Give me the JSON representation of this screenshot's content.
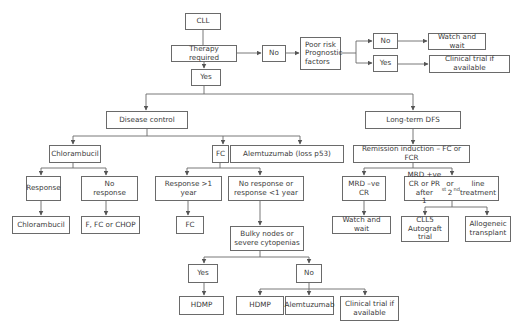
{
  "diagram": {
    "type": "flowchart",
    "colors": {
      "stroke": "#6a6a6a",
      "text": "#3a3a3a",
      "background": "#ffffff"
    },
    "nodes": [
      {
        "id": "cll",
        "label": "CLL",
        "x": 185,
        "y": 13,
        "w": 36,
        "h": 17
      },
      {
        "id": "therapy_required",
        "label": "Therapy required",
        "x": 171,
        "y": 45,
        "w": 66,
        "h": 17
      },
      {
        "id": "no_top",
        "label": "No",
        "x": 262,
        "y": 45,
        "w": 24,
        "h": 17
      },
      {
        "id": "poor_risk",
        "label": "Poor risk\nPrognostic\nfactors",
        "x": 300,
        "y": 37,
        "w": 41,
        "h": 33,
        "align": "left"
      },
      {
        "id": "no_right",
        "label": "No",
        "x": 373,
        "y": 33,
        "w": 25,
        "h": 16
      },
      {
        "id": "yes_right",
        "label": "Yes",
        "x": 373,
        "y": 55,
        "w": 25,
        "h": 17
      },
      {
        "id": "watch_wait_top",
        "label": "Watch and wait",
        "x": 428,
        "y": 33,
        "w": 58,
        "h": 17
      },
      {
        "id": "clinical_trial_top",
        "label": "Clinical trial if available",
        "x": 429,
        "y": 55,
        "w": 81,
        "h": 18
      },
      {
        "id": "yes_mid",
        "label": "Yes",
        "x": 191,
        "y": 69,
        "w": 30,
        "h": 17
      },
      {
        "id": "disease_control",
        "label": "Disease control",
        "x": 106,
        "y": 111,
        "w": 82,
        "h": 18
      },
      {
        "id": "long_term_dfs",
        "label": "Long-term DFS",
        "x": 365,
        "y": 111,
        "w": 96,
        "h": 18
      },
      {
        "id": "chlorambucil_1",
        "label": "Chlorambucil",
        "x": 49,
        "y": 145,
        "w": 52,
        "h": 18
      },
      {
        "id": "fc_1",
        "label": "FC",
        "x": 212,
        "y": 145,
        "w": 17,
        "h": 18
      },
      {
        "id": "alemtuzumab_p53",
        "label": "Alemtuzumab (loss p53)",
        "x": 230,
        "y": 145,
        "w": 114,
        "h": 18
      },
      {
        "id": "remission_induction",
        "label": "Remission induction – FC or FCR",
        "x": 353,
        "y": 145,
        "w": 117,
        "h": 18
      },
      {
        "id": "response",
        "label": "Response",
        "x": 26,
        "y": 176,
        "w": 35,
        "h": 25
      },
      {
        "id": "no_response",
        "label": "No\nresponse",
        "x": 81,
        "y": 176,
        "w": 57,
        "h": 25
      },
      {
        "id": "response_gt1",
        "label": "Response >1\nyear",
        "x": 155,
        "y": 176,
        "w": 67,
        "h": 25
      },
      {
        "id": "no_response_lt1",
        "label": "No response or\nresponse <1 year",
        "x": 228,
        "y": 176,
        "w": 76,
        "h": 25
      },
      {
        "id": "mrd_neg_cr",
        "label": "MRD –ve\nCR",
        "x": 342,
        "y": 176,
        "w": 44,
        "h": 25
      },
      {
        "id": "mrd_pos",
        "label": "MRD +ve CR or PR after\n1st or 2nd line treatment",
        "x": 404,
        "y": 176,
        "w": 95,
        "h": 25
      },
      {
        "id": "chlorambucil_2",
        "label": "Chlorambucil",
        "x": 12,
        "y": 216,
        "w": 58,
        "h": 18
      },
      {
        "id": "f_fc_chop",
        "label": "F, FC or CHOP",
        "x": 81,
        "y": 216,
        "w": 59,
        "h": 18
      },
      {
        "id": "fc_2",
        "label": "FC",
        "x": 176,
        "y": 216,
        "w": 28,
        "h": 18
      },
      {
        "id": "bulky_nodes",
        "label": "Bulky nodes or\nsevere cytopenias",
        "x": 230,
        "y": 226,
        "w": 74,
        "h": 25
      },
      {
        "id": "watch_wait_bottom",
        "label": "Watch and wait",
        "x": 332,
        "y": 216,
        "w": 59,
        "h": 18
      },
      {
        "id": "cll5_autograft",
        "label": "CLL5\nAutograft trial",
        "x": 401,
        "y": 216,
        "w": 48,
        "h": 26
      },
      {
        "id": "allogeneic",
        "label": "Allogeneic\ntransplant",
        "x": 465,
        "y": 216,
        "w": 46,
        "h": 26
      },
      {
        "id": "yes_bottom",
        "label": "Yes",
        "x": 188,
        "y": 264,
        "w": 30,
        "h": 19
      },
      {
        "id": "no_bottom",
        "label": "No",
        "x": 296,
        "y": 264,
        "w": 26,
        "h": 19
      },
      {
        "id": "hdmp_1",
        "label": "HDMP",
        "x": 179,
        "y": 296,
        "w": 45,
        "h": 19
      },
      {
        "id": "hdmp_2",
        "label": "HDMP",
        "x": 236,
        "y": 296,
        "w": 48,
        "h": 19
      },
      {
        "id": "alemtuzumab",
        "label": "Alemtuzumab",
        "x": 285,
        "y": 296,
        "w": 49,
        "h": 19
      },
      {
        "id": "clinical_trial_bottom",
        "label": "Clinical trial if\navailable",
        "x": 340,
        "y": 296,
        "w": 59,
        "h": 25
      }
    ],
    "edges": [
      {
        "from": "cll",
        "to": "therapy_required",
        "arrow": false
      },
      {
        "from": "therapy_required",
        "to": "no_top",
        "arrow": true
      },
      {
        "from": "no_top",
        "to": "poor_risk",
        "arrow": true
      },
      {
        "from": "poor_risk",
        "to": "no_right",
        "arrow": true
      },
      {
        "from": "poor_risk",
        "to": "yes_right",
        "arrow": true
      },
      {
        "from": "no_right",
        "to": "watch_wait_top",
        "arrow": true
      },
      {
        "from": "yes_right",
        "to": "clinical_trial_top",
        "arrow": true
      },
      {
        "from": "therapy_required",
        "to": "yes_mid",
        "arrow": true
      },
      {
        "from": "yes_mid",
        "to": "disease_control",
        "arrow": true
      },
      {
        "from": "yes_mid",
        "to": "long_term_dfs",
        "arrow": true
      },
      {
        "from": "disease_control",
        "to": "chlorambucil_1",
        "arrow": true
      },
      {
        "from": "disease_control",
        "to": "fc_1",
        "arrow": true
      },
      {
        "from": "disease_control",
        "to": "alemtuzumab_p53",
        "arrow": true
      },
      {
        "from": "long_term_dfs",
        "to": "remission_induction",
        "arrow": true
      },
      {
        "from": "chlorambucil_1",
        "to": "response",
        "arrow": true
      },
      {
        "from": "chlorambucil_1",
        "to": "no_response",
        "arrow": true
      },
      {
        "from": "response",
        "to": "chlorambucil_2",
        "arrow": true
      },
      {
        "from": "no_response",
        "to": "f_fc_chop",
        "arrow": true
      },
      {
        "from": "fc_1",
        "to": "response_gt1",
        "arrow": true
      },
      {
        "from": "fc_1",
        "to": "no_response_lt1",
        "arrow": true
      },
      {
        "from": "response_gt1",
        "to": "fc_2",
        "arrow": true
      },
      {
        "from": "no_response_lt1",
        "to": "bulky_nodes",
        "arrow": true
      },
      {
        "from": "bulky_nodes",
        "to": "yes_bottom",
        "arrow": true
      },
      {
        "from": "bulky_nodes",
        "to": "no_bottom",
        "arrow": true
      },
      {
        "from": "yes_bottom",
        "to": "hdmp_1",
        "arrow": true
      },
      {
        "from": "no_bottom",
        "to": "hdmp_2",
        "arrow": true
      },
      {
        "from": "no_bottom",
        "to": "alemtuzumab",
        "arrow": true
      },
      {
        "from": "no_bottom",
        "to": "clinical_trial_bottom",
        "arrow": true
      },
      {
        "from": "remission_induction",
        "to": "mrd_neg_cr",
        "arrow": true
      },
      {
        "from": "remission_induction",
        "to": "mrd_pos",
        "arrow": true
      },
      {
        "from": "mrd_neg_cr",
        "to": "watch_wait_bottom",
        "arrow": true
      },
      {
        "from": "mrd_pos",
        "to": "cll5_autograft",
        "arrow": true
      },
      {
        "from": "mrd_pos",
        "to": "allogeneic",
        "arrow": true
      }
    ]
  }
}
